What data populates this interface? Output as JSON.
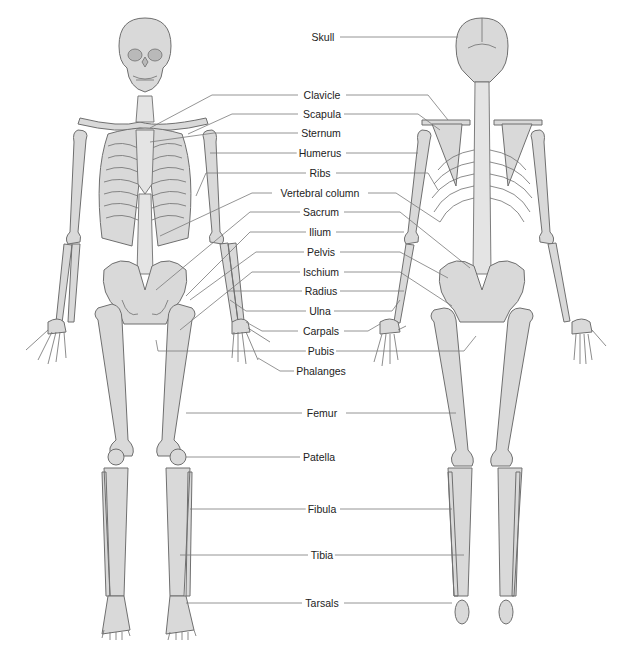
{
  "diagram": {
    "type": "anatomical skeleton diagram",
    "views": [
      "anterior",
      "posterior"
    ],
    "colors": {
      "bone_fill": "#d9d9d9",
      "bone_outline": "#6f6f6f",
      "leader_line": "#7a7a7a",
      "background": "#ffffff",
      "label_text": "#222222"
    },
    "labels": [
      {
        "id": "skull",
        "text": "Skull",
        "x": 323,
        "y": 37
      },
      {
        "id": "clavicle",
        "text": "Clavicle",
        "x": 322,
        "y": 95
      },
      {
        "id": "scapula",
        "text": "Scapula",
        "x": 322,
        "y": 114
      },
      {
        "id": "sternum",
        "text": "Sternum",
        "x": 321,
        "y": 133
      },
      {
        "id": "humerus",
        "text": "Humerus",
        "x": 320,
        "y": 153
      },
      {
        "id": "ribs",
        "text": "Ribs",
        "x": 320,
        "y": 173
      },
      {
        "id": "vertebral-column",
        "text": "Vertebral column",
        "x": 320,
        "y": 193
      },
      {
        "id": "sacrum",
        "text": "Sacrum",
        "x": 321,
        "y": 212
      },
      {
        "id": "ilium",
        "text": "Ilium",
        "x": 320,
        "y": 232
      },
      {
        "id": "pelvis",
        "text": "Pelvis",
        "x": 321,
        "y": 252
      },
      {
        "id": "ischium",
        "text": "Ischium",
        "x": 321,
        "y": 272
      },
      {
        "id": "radius",
        "text": "Radius",
        "x": 321,
        "y": 291
      },
      {
        "id": "ulna",
        "text": "Ulna",
        "x": 320,
        "y": 311
      },
      {
        "id": "carpals",
        "text": "Carpals",
        "x": 321,
        "y": 331
      },
      {
        "id": "pubis",
        "text": "Pubis",
        "x": 321,
        "y": 351
      },
      {
        "id": "phalanges",
        "text": "Phalanges",
        "x": 321,
        "y": 371
      },
      {
        "id": "femur",
        "text": "Femur",
        "x": 322,
        "y": 413
      },
      {
        "id": "patella",
        "text": "Patella",
        "x": 319,
        "y": 457
      },
      {
        "id": "fibula",
        "text": "Fibula",
        "x": 322,
        "y": 509
      },
      {
        "id": "tibia",
        "text": "Tibia",
        "x": 322,
        "y": 555
      },
      {
        "id": "tarsals",
        "text": "Tarsals",
        "x": 322,
        "y": 603
      }
    ]
  }
}
